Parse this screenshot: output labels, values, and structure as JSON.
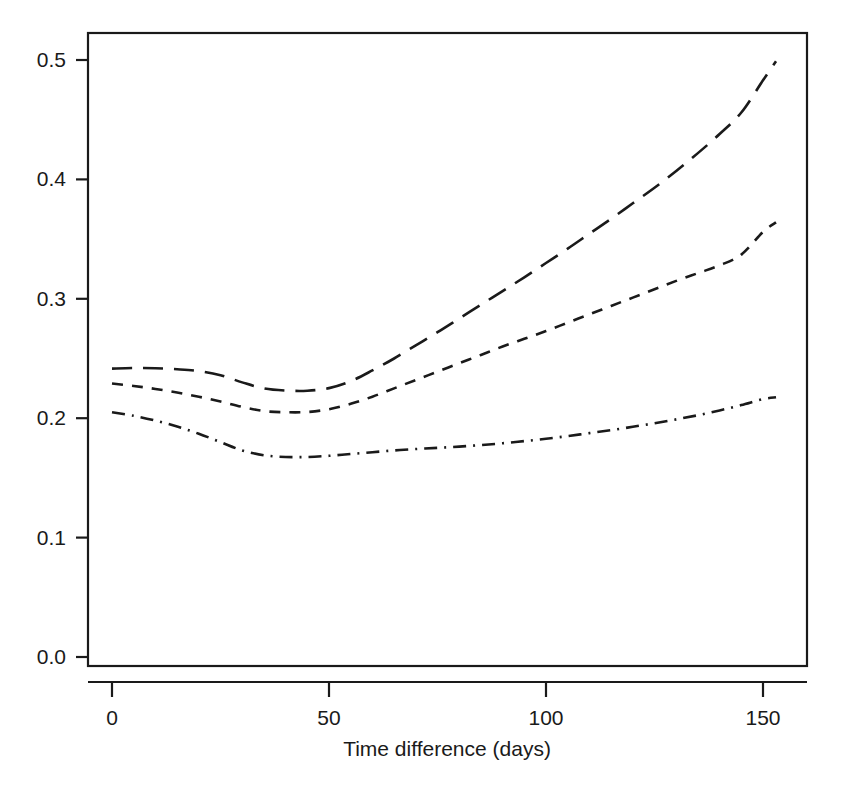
{
  "chart_data": {
    "type": "line",
    "title": "",
    "subtitle": "",
    "xlabel": "Time difference (days)",
    "ylabel": "",
    "xlim": [
      -5,
      160
    ],
    "ylim": [
      0.0,
      0.52
    ],
    "grid": false,
    "legend": "none",
    "xticks": [
      0,
      50,
      100,
      150
    ],
    "xticklabels": [
      "0",
      "50",
      "100",
      "150"
    ],
    "yticks": [
      0.0,
      0.1,
      0.2,
      0.3,
      0.4,
      0.5
    ],
    "yticklabels": [
      "0.0",
      "0.1",
      "0.2",
      "0.3",
      "0.4",
      "0.5"
    ],
    "x": [
      0,
      5,
      10,
      15,
      20,
      25,
      30,
      35,
      40,
      45,
      50,
      55,
      60,
      65,
      70,
      75,
      80,
      85,
      90,
      95,
      100,
      105,
      110,
      115,
      120,
      125,
      130,
      135,
      140,
      145,
      150,
      153
    ],
    "series": [
      {
        "name": "upper-curve",
        "linestyle": "long-dash",
        "color": "#1a1a1a",
        "values": [
          0.2415,
          0.242,
          0.2418,
          0.241,
          0.2395,
          0.236,
          0.23,
          0.225,
          0.2232,
          0.223,
          0.2252,
          0.231,
          0.24,
          0.25,
          0.261,
          0.272,
          0.2835,
          0.295,
          0.3065,
          0.318,
          0.33,
          0.342,
          0.3545,
          0.367,
          0.38,
          0.393,
          0.407,
          0.422,
          0.438,
          0.456,
          0.483,
          0.499
        ]
      },
      {
        "name": "middle-curve",
        "linestyle": "short-dash",
        "color": "#1a1a1a",
        "values": [
          0.229,
          0.227,
          0.2245,
          0.2215,
          0.218,
          0.214,
          0.2095,
          0.206,
          0.205,
          0.2052,
          0.2075,
          0.212,
          0.218,
          0.225,
          0.232,
          0.239,
          0.246,
          0.253,
          0.26,
          0.2665,
          0.273,
          0.28,
          0.287,
          0.294,
          0.301,
          0.308,
          0.315,
          0.3215,
          0.328,
          0.337,
          0.356,
          0.364
        ]
      },
      {
        "name": "lower-curve",
        "linestyle": "dash-dot",
        "color": "#1a1a1a",
        "values": [
          0.205,
          0.202,
          0.198,
          0.193,
          0.187,
          0.18,
          0.173,
          0.169,
          0.1675,
          0.1675,
          0.1685,
          0.17,
          0.1715,
          0.173,
          0.1742,
          0.1752,
          0.1762,
          0.1775,
          0.179,
          0.1808,
          0.1828,
          0.185,
          0.1875,
          0.19,
          0.1928,
          0.1958,
          0.199,
          0.2025,
          0.2065,
          0.211,
          0.216,
          0.2175
        ]
      }
    ]
  },
  "axes": {
    "x_axis_label": "Time difference (days)",
    "y_axis_label": ""
  }
}
